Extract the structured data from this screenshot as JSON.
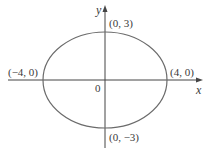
{
  "diagram": {
    "type": "ellipse-on-axes",
    "equation_implied": "x^2/16 + y^2/9 = 1",
    "axes": {
      "x_label": "x",
      "y_label": "y",
      "origin_label": "0"
    },
    "points": [
      {
        "label": "(0, 3)",
        "x": 0,
        "y": 3
      },
      {
        "label": "(−4, 0)",
        "x": -4,
        "y": 0
      },
      {
        "label": "(4, 0)",
        "x": 4,
        "y": 0
      },
      {
        "label": "(0, −3)",
        "x": 0,
        "y": -3
      }
    ],
    "colors": {
      "curve": "#6b6b6b",
      "axes": "#444444",
      "text": "#3a3a3a"
    }
  }
}
